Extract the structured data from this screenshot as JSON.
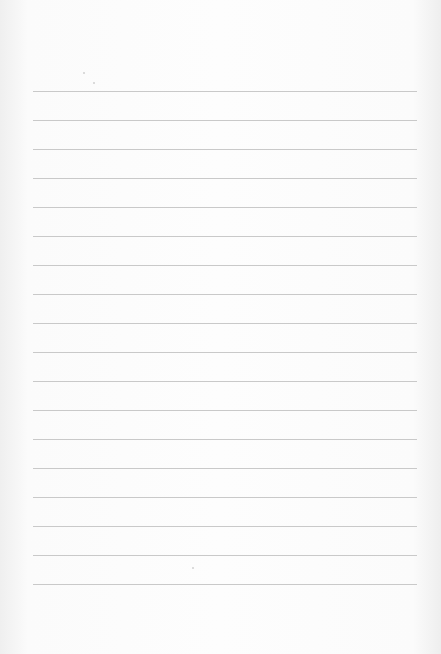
{
  "page": {
    "type": "blank ruled paper",
    "line_color": "#c9c9c9",
    "background_color": "#fcfcfc",
    "line_count": 18,
    "first_line_y": 91,
    "line_spacing": 29,
    "line_left": 33,
    "line_right": 417
  }
}
